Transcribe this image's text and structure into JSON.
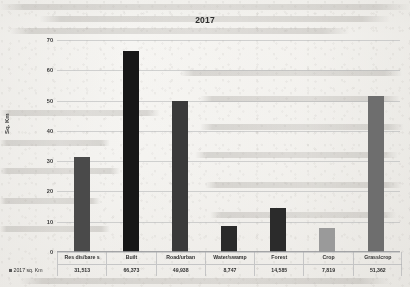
{
  "chart_data": {
    "type": "bar",
    "title": "2017",
    "xlabel": "",
    "ylabel": "Sq. Km",
    "ylim": [
      0,
      70
    ],
    "yticks": [
      0,
      10,
      20,
      30,
      40,
      50,
      60,
      70
    ],
    "grid": true,
    "legend_position": "bottom-left",
    "series_name": "2017 sq. Km",
    "units_note": "values in table are in sq. Km; bars plotted in thousands",
    "categories": [
      "Res dis/bare s",
      "Built",
      "Road/urban",
      "Water/swamp",
      "Forest",
      "Crop",
      "Grass/crop"
    ],
    "values": [
      31.513,
      66.373,
      49.938,
      8.747,
      14.585,
      7.819,
      51.362
    ],
    "value_labels": [
      "31,513",
      "66,373",
      "49,938",
      "8,747",
      "14,585",
      "7,819",
      "51,362"
    ],
    "bar_colors": [
      "#4a4a4a",
      "#171717",
      "#3a3a3a",
      "#2a2a2a",
      "#2b2b2b",
      "#9a9a9a",
      "#6e6e6e"
    ]
  },
  "table": {
    "legend_label": "2017 sq. Km",
    "legend_swatch_color": "#5a5a5a"
  }
}
